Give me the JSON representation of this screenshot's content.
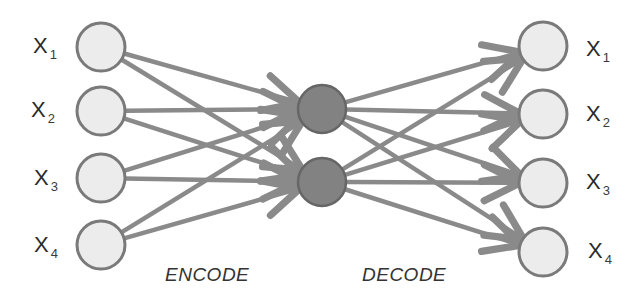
{
  "diagram": {
    "colors": {
      "edge": "#8a8a8a",
      "input_fill": "#ececec",
      "input_stroke": "#7a7a7a",
      "hidden_fill": "#828282",
      "hidden_stroke": "#666666",
      "label_text": "#2a2a2a"
    },
    "stages": {
      "encode": "ENCODE",
      "decode": "DECODE"
    },
    "input_nodes": [
      {
        "id": "in1",
        "label": "X",
        "sub": "1",
        "cx": 101,
        "cy": 47
      },
      {
        "id": "in2",
        "label": "X",
        "sub": "2",
        "cx": 101,
        "cy": 111
      },
      {
        "id": "in3",
        "label": "X",
        "sub": "3",
        "cx": 101,
        "cy": 178
      },
      {
        "id": "in4",
        "label": "X",
        "sub": "4",
        "cx": 101,
        "cy": 245
      }
    ],
    "hidden_nodes": [
      {
        "id": "h1",
        "cx": 322,
        "cy": 109
      },
      {
        "id": "h2",
        "cx": 322,
        "cy": 182
      }
    ],
    "output_nodes": [
      {
        "id": "out1",
        "label": "X",
        "sub": "1",
        "cx": 543,
        "cy": 46
      },
      {
        "id": "out2",
        "label": "X",
        "sub": "2",
        "cx": 543,
        "cy": 114
      },
      {
        "id": "out3",
        "label": "X",
        "sub": "3",
        "cx": 543,
        "cy": 183
      },
      {
        "id": "out4",
        "label": "X",
        "sub": "4",
        "cx": 543,
        "cy": 252
      }
    ],
    "edges": {
      "encode": "every input node connects to every hidden node (arrows point to hidden)",
      "decode": "every hidden node connects to every output node (arrows point to output)"
    }
  }
}
